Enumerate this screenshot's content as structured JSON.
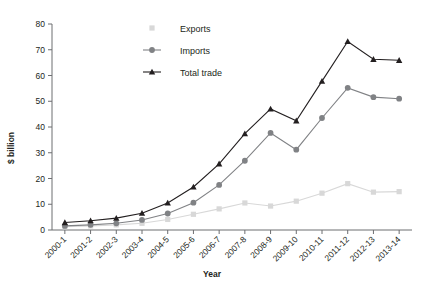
{
  "chart_data": {
    "type": "line",
    "title": "",
    "xlabel": "Year",
    "ylabel": "$ billion",
    "ylim": [
      0,
      80
    ],
    "ystep": 10,
    "grid": false,
    "legend_position": "top-center",
    "categories": [
      "2000-1",
      "2001-2",
      "2002-3",
      "2003-4",
      "2004-5",
      "2005-6",
      "2006-7",
      "2007-8",
      "2008-9",
      "2009-10",
      "2010-11",
      "2011-12",
      "2012-13",
      "2013-14"
    ],
    "ytick_labels": [
      "0",
      "10",
      "20",
      "30",
      "40",
      "50",
      "60",
      "70",
      "80"
    ],
    "series": [
      {
        "name": "Exports",
        "color": "#d8d8d8",
        "marker": "square",
        "values": [
          1.3,
          1.6,
          2.0,
          2.6,
          4.1,
          6.1,
          8.2,
          10.5,
          9.3,
          11.2,
          14.3,
          18.0,
          14.7,
          14.9
        ]
      },
      {
        "name": "Imports",
        "color": "#808285",
        "marker": "circle",
        "values": [
          1.6,
          2.0,
          2.6,
          3.9,
          6.4,
          10.6,
          17.5,
          26.9,
          37.7,
          31.2,
          43.5,
          55.2,
          51.6,
          51.0
        ]
      },
      {
        "name": "Total trade",
        "color": "#231f20",
        "marker": "triangle",
        "values": [
          2.9,
          3.6,
          4.6,
          6.5,
          10.5,
          16.7,
          25.7,
          37.4,
          47.0,
          42.4,
          57.8,
          73.2,
          66.3,
          65.9
        ]
      }
    ]
  },
  "legend": {
    "items": [
      {
        "label": "Exports"
      },
      {
        "label": "Imports"
      },
      {
        "label": "Total trade"
      }
    ]
  }
}
